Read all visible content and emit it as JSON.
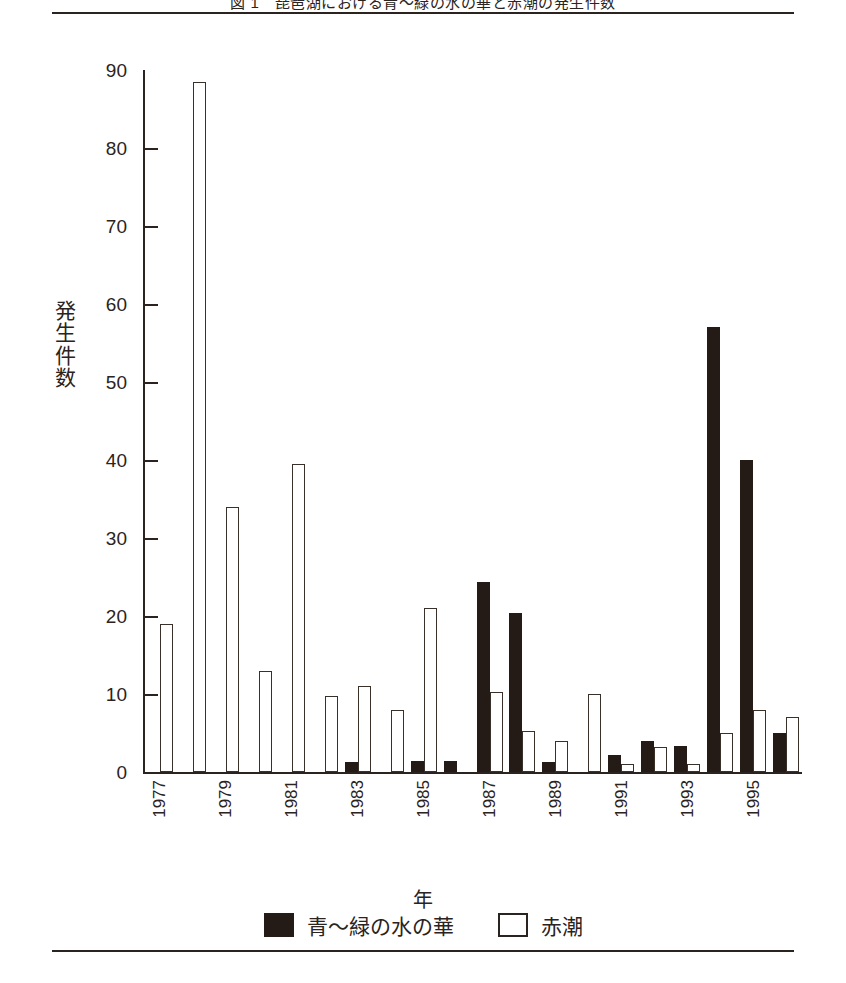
{
  "figure": {
    "title": "図  1　琵琶湖における青〜緑の水の華と赤潮の発生件数",
    "y_axis_title": "発生件数",
    "y_axis_title_chars": [
      "発",
      "生",
      "件",
      "数"
    ],
    "x_axis_title": "年"
  },
  "legend": {
    "items": [
      {
        "label": "青〜緑の水の華",
        "swatch": "filled-black",
        "color": "#241b16"
      },
      {
        "label": "赤潮",
        "swatch": "outlined-white",
        "color": "#ffffff"
      }
    ]
  },
  "y_axis": {
    "ticks": [
      "0",
      "10",
      "20",
      "30",
      "40",
      "50",
      "60",
      "70",
      "80",
      "90"
    ],
    "min": 0,
    "max": 90,
    "step": 10
  },
  "x_axis": {
    "visible_tick_labels": [
      "1977",
      "1979",
      "1981",
      "1983",
      "1985",
      "1987",
      "1989",
      "1991",
      "1993",
      "1995"
    ]
  },
  "chart_data": {
    "type": "bar",
    "title": "図  1　琵琶湖における青〜緑の水の華と赤潮の発生件数",
    "xlabel": "年",
    "ylabel": "発生件数",
    "ylim": [
      0,
      90
    ],
    "grid": false,
    "legend_position": "bottom-center",
    "categories": [
      "1977",
      "1978",
      "1979",
      "1980",
      "1981",
      "1982",
      "1983",
      "1984",
      "1985",
      "1986",
      "1987",
      "1988",
      "1989",
      "1990",
      "1991",
      "1992",
      "1993",
      "1994",
      "1995",
      "1996"
    ],
    "labeled_categories": [
      "1977",
      "1979",
      "1981",
      "1983",
      "1985",
      "1987",
      "1989",
      "1991",
      "1993",
      "1995"
    ],
    "series": [
      {
        "name": "青〜緑の水の華",
        "color": "#241b16",
        "values": [
          0,
          0,
          0,
          0,
          0,
          0,
          1.3,
          0,
          1.4,
          1.4,
          24.3,
          20.4,
          1.3,
          0,
          2.2,
          4.0,
          3.3,
          57.0,
          40.0,
          5.0
        ]
      },
      {
        "name": "赤潮",
        "color": "#ffffff",
        "values": [
          19.0,
          88.5,
          34.0,
          13.0,
          39.5,
          9.8,
          11.0,
          8.0,
          21.0,
          0,
          10.2,
          5.2,
          4.0,
          10.0,
          1.0,
          3.2,
          1.0,
          5.0,
          8.0,
          7.0
        ]
      }
    ]
  }
}
